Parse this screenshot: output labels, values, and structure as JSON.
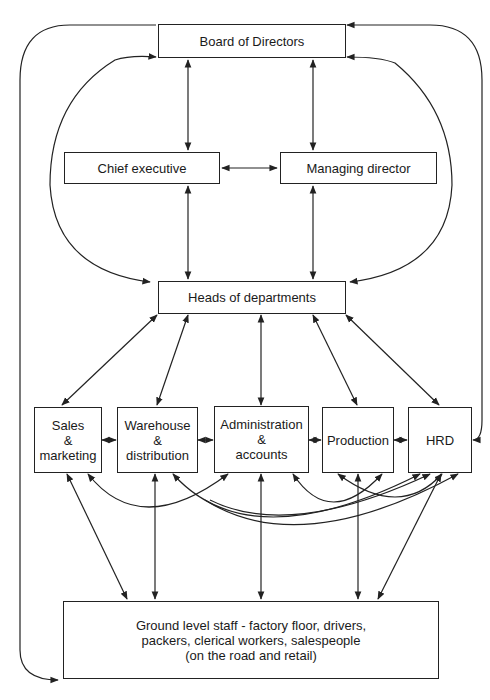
{
  "diagram": {
    "type": "organizational communication flow",
    "nodes": {
      "board": "Board of Directors",
      "chief": "Chief executive",
      "managing": "Managing director",
      "heads": "Heads of departments",
      "sales": [
        "Sales",
        "&",
        "marketing"
      ],
      "warehouse": [
        "Warehouse",
        "&",
        "distribution"
      ],
      "admin": [
        "Administration",
        "&",
        "accounts"
      ],
      "production": "Production",
      "hrd": "HRD",
      "ground": [
        "Ground level staff - factory floor, drivers,",
        "packers, clerical workers, salespeople",
        "(on the road and retail)"
      ]
    },
    "edges": [
      {
        "from": "board",
        "to": "chief",
        "direction": "both"
      },
      {
        "from": "board",
        "to": "managing",
        "direction": "both"
      },
      {
        "from": "chief",
        "to": "managing",
        "direction": "both"
      },
      {
        "from": "chief",
        "to": "heads",
        "direction": "both"
      },
      {
        "from": "managing",
        "to": "heads",
        "direction": "both"
      },
      {
        "from": "board",
        "to": "heads",
        "direction": "both",
        "style": "inner loop left and right"
      },
      {
        "from": "heads",
        "to": "sales",
        "direction": "both"
      },
      {
        "from": "heads",
        "to": "warehouse",
        "direction": "both"
      },
      {
        "from": "heads",
        "to": "admin",
        "direction": "both"
      },
      {
        "from": "heads",
        "to": "production",
        "direction": "both"
      },
      {
        "from": "heads",
        "to": "hrd",
        "direction": "both"
      },
      {
        "from": "sales",
        "to": "warehouse",
        "direction": "both"
      },
      {
        "from": "warehouse",
        "to": "admin",
        "direction": "both"
      },
      {
        "from": "admin",
        "to": "production",
        "direction": "both"
      },
      {
        "from": "production",
        "to": "hrd",
        "direction": "both"
      },
      {
        "from": "sales",
        "to": "ground",
        "direction": "both"
      },
      {
        "from": "warehouse",
        "to": "ground",
        "direction": "both"
      },
      {
        "from": "admin",
        "to": "ground",
        "direction": "both"
      },
      {
        "from": "production",
        "to": "hrd",
        "direction": "both",
        "style": "curve below"
      },
      {
        "from": "production",
        "to": "ground",
        "direction": "both"
      },
      {
        "from": "hrd",
        "to": "ground",
        "direction": "both"
      },
      {
        "from": "board",
        "to": "ground",
        "direction": "to-ground",
        "style": "outer loop left"
      },
      {
        "from": "board",
        "to": "hrd",
        "direction": "to-hrd",
        "style": "outer loop right"
      }
    ]
  }
}
